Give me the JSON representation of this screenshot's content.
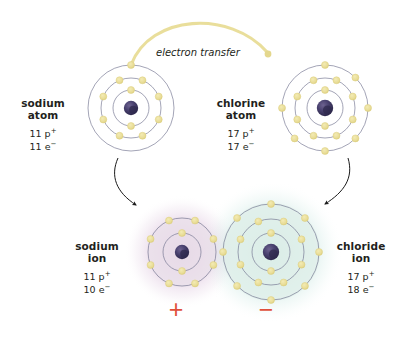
{
  "figure": {
    "background": "#ffffff",
    "annotation": "electron transfer"
  },
  "colors": {
    "electron": "#e8dc96",
    "electron_stroke": "#ddcf7e",
    "shell_line": "#6e6f8c",
    "nucleus": "#4a4270",
    "nucleus_dark": "#2f2a4d",
    "transfer_arc": "#e8dc96",
    "black_arrow": "#1a1a1a",
    "plus_sign": "#e0503c",
    "minus_sign": "#e0503c",
    "text": "#231f20",
    "sodium_ion_glow": "#c9a7c9",
    "chloride_ion_glow": "#a8d8cf"
  },
  "atoms": [
    {
      "id": "sodium-atom",
      "name_line1": "sodium",
      "name_line2": "atom",
      "protons": "11 p",
      "protons_sup": "+",
      "electrons": "11 e",
      "electrons_sup": "−",
      "shell_electron_counts": [
        2,
        8,
        1
      ],
      "shell_radii": [
        18,
        30,
        43
      ],
      "center": {
        "x": 131,
        "y": 108
      },
      "label_position": "left",
      "glow": "none"
    },
    {
      "id": "chlorine-atom",
      "name_line1": "chlorine",
      "name_line2": "atom",
      "protons": "17 p",
      "protons_sup": "+",
      "electrons": "17 e",
      "electrons_sup": "−",
      "shell_electron_counts": [
        2,
        8,
        7
      ],
      "shell_radii": [
        18,
        30,
        43
      ],
      "center": {
        "x": 325,
        "y": 108
      },
      "label_position": "left",
      "glow": "none"
    },
    {
      "id": "sodium-ion",
      "name_line1": "sodium",
      "name_line2": "ion",
      "protons": "11 p",
      "protons_sup": "+",
      "electrons": "10 e",
      "electrons_sup": "−",
      "shell_electron_counts": [
        2,
        8
      ],
      "shell_radii": [
        19,
        34
      ],
      "center": {
        "x": 182,
        "y": 252
      },
      "label_position": "left",
      "glow": "#c9a7c9"
    },
    {
      "id": "chloride-ion",
      "name_line1": "chloride",
      "name_line2": "ion",
      "protons": "17 p",
      "protons_sup": "+",
      "electrons": "18 e",
      "electrons_sup": "−",
      "shell_electron_counts": [
        2,
        8,
        8
      ],
      "shell_radii": [
        19,
        33,
        48
      ],
      "center": {
        "x": 271,
        "y": 252
      },
      "label_position": "right",
      "glow": "#a8d8cf"
    }
  ],
  "charges": [
    {
      "id": "positive-charge",
      "symbol": "+",
      "x": 175,
      "y": 303
    },
    {
      "id": "negative-charge",
      "symbol": "−",
      "x": 265,
      "y": 303
    }
  ],
  "chart_data": {
    "type": "diagram",
    "annotations": [
      "electron transfer",
      "+",
      "−"
    ],
    "entities": [
      {
        "label": "sodium atom",
        "protons": 11,
        "electrons": 11,
        "shells": [
          2,
          8,
          1
        ],
        "charge": 0
      },
      {
        "label": "chlorine atom",
        "protons": 17,
        "electrons": 17,
        "shells": [
          2,
          8,
          7
        ],
        "charge": 0
      },
      {
        "label": "sodium ion",
        "protons": 11,
        "electrons": 10,
        "shells": [
          2,
          8
        ],
        "charge": 1
      },
      {
        "label": "chloride ion",
        "protons": 17,
        "electrons": 18,
        "shells": [
          2,
          8,
          8
        ],
        "charge": -1
      }
    ],
    "flows": [
      {
        "from": "sodium atom",
        "to": "chlorine atom",
        "label": "electron transfer",
        "style": "yellow-arc"
      },
      {
        "from": "sodium atom",
        "to": "sodium ion",
        "label": "",
        "style": "black-arrow"
      },
      {
        "from": "chlorine atom",
        "to": "chloride ion",
        "label": "",
        "style": "black-arrow"
      }
    ]
  }
}
